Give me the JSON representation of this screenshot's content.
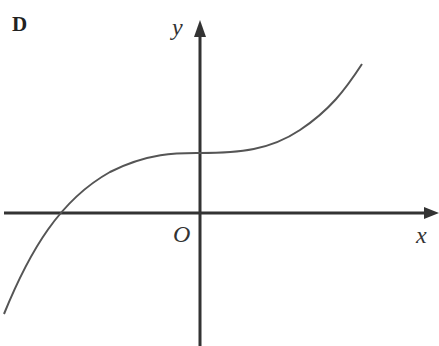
{
  "figure": {
    "panel_label": "D",
    "x_axis_label": "x",
    "y_axis_label": "y",
    "origin_label": "O",
    "curve_description": "Increasing cubic-like curve with a flat (inflection) region crossing the positive y-axis, one negative x-intercept",
    "colors": {
      "axis": "#333333",
      "curve": "#555555",
      "background": "#ffffff"
    }
  }
}
